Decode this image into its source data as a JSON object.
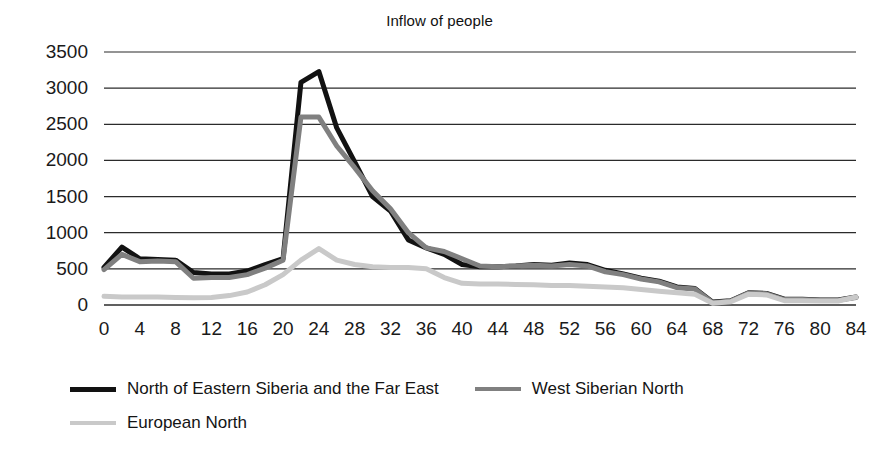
{
  "chart_data": {
    "type": "line",
    "title": "Inflow of people",
    "xlabel": "",
    "ylabel": "",
    "xlim": [
      0,
      84
    ],
    "ylim": [
      0,
      3500
    ],
    "ytick_step": 500,
    "xtick_step": 4,
    "grid": "horizontal",
    "legend_position": "bottom-left",
    "xticks": [
      0,
      4,
      8,
      12,
      16,
      20,
      24,
      28,
      32,
      36,
      40,
      44,
      48,
      52,
      56,
      60,
      64,
      68,
      72,
      76,
      80,
      84
    ],
    "yticks": [
      0,
      500,
      1000,
      1500,
      2000,
      2500,
      3000,
      3500
    ],
    "x": [
      0,
      2,
      4,
      6,
      8,
      10,
      12,
      14,
      16,
      18,
      20,
      22,
      24,
      26,
      28,
      30,
      32,
      34,
      36,
      38,
      40,
      42,
      44,
      46,
      48,
      50,
      52,
      54,
      56,
      58,
      60,
      62,
      64,
      66,
      68,
      70,
      72,
      74,
      76,
      78,
      80,
      82,
      84
    ],
    "series": [
      {
        "name": "North of Eastern Siberia and the Far East",
        "color": "#121212",
        "width": 5,
        "values": [
          520,
          800,
          640,
          630,
          620,
          450,
          430,
          430,
          470,
          560,
          640,
          3080,
          3230,
          2450,
          1980,
          1500,
          1300,
          900,
          790,
          700,
          560,
          530,
          530,
          540,
          560,
          550,
          580,
          560,
          480,
          430,
          370,
          330,
          250,
          230,
          40,
          60,
          170,
          160,
          80,
          80,
          70,
          70,
          110
        ]
      },
      {
        "name": "West Siberian North",
        "color": "#808080",
        "width": 5,
        "values": [
          490,
          700,
          600,
          610,
          600,
          370,
          380,
          380,
          420,
          510,
          620,
          2600,
          2600,
          2200,
          1900,
          1580,
          1330,
          1000,
          790,
          740,
          640,
          540,
          530,
          540,
          550,
          540,
          560,
          540,
          460,
          420,
          360,
          320,
          240,
          220,
          30,
          55,
          165,
          155,
          75,
          75,
          65,
          65,
          105
        ]
      },
      {
        "name": "European North",
        "color": "#c9c9c9",
        "width": 5,
        "values": [
          120,
          110,
          110,
          110,
          105,
          100,
          105,
          130,
          180,
          280,
          420,
          620,
          780,
          620,
          560,
          530,
          520,
          520,
          500,
          380,
          300,
          290,
          290,
          285,
          280,
          270,
          270,
          260,
          250,
          240,
          215,
          190,
          170,
          150,
          25,
          45,
          150,
          140,
          60,
          60,
          55,
          55,
          110
        ]
      }
    ]
  },
  "legend": {
    "entries": [
      {
        "label": "North of Eastern Siberia and the Far East",
        "color": "#121212"
      },
      {
        "label": "West Siberian North",
        "color": "#808080"
      },
      {
        "label": "European North",
        "color": "#c9c9c9"
      }
    ]
  }
}
